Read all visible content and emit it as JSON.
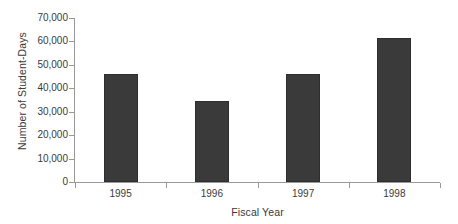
{
  "chart_data": {
    "type": "bar",
    "title": "",
    "xlabel": "Fiscal Year",
    "ylabel": "Number of Student-Days",
    "categories": [
      "1995",
      "1996",
      "1997",
      "1998"
    ],
    "values": [
      46000,
      34500,
      46000,
      61500
    ],
    "ylim": [
      0,
      70000
    ],
    "ytick_values": [
      0,
      10000,
      20000,
      30000,
      40000,
      50000,
      60000,
      70000
    ],
    "ytick_labels": [
      "0",
      "10,000",
      "20,000",
      "30,000",
      "40,000",
      "50,000",
      "60,000",
      "70,000"
    ],
    "grid": false,
    "legend": false,
    "bar_color": "#3a3a3a",
    "axis_color": "#999999",
    "background": "#ffffff"
  }
}
